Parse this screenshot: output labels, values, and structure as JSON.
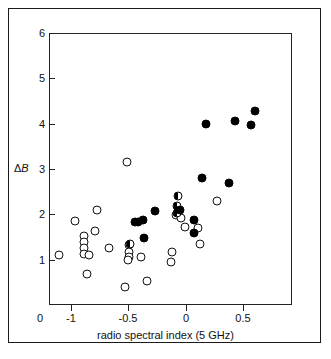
{
  "figure": {
    "background_color": "#ffffff",
    "frame_color": "#1a1a1a",
    "marker_color": "#000000"
  },
  "axes": {
    "y_title_delta": "Δ",
    "y_title_symbol": "B",
    "x_title": "radio spectral index (5 GHz)",
    "origin_label": "0",
    "y_ticks": [
      "0",
      "1",
      "2",
      "3",
      "4",
      "5",
      "6"
    ],
    "x_ticks": [
      "-1",
      "-0.5",
      "0",
      "0.5"
    ]
  },
  "chart_data": {
    "type": "scatter",
    "title": "",
    "xlabel": "radio spectral index (5 GHz)",
    "ylabel": "ΔB",
    "xlim": [
      -1.13,
      1.0
    ],
    "ylim": [
      0,
      6
    ],
    "xticks": [
      -1,
      -0.5,
      0,
      0.5
    ],
    "yticks": [
      0,
      1,
      2,
      3,
      4,
      5,
      6
    ],
    "grid": false,
    "legend": "none",
    "series": [
      {
        "name": "open-circle",
        "marker": "open",
        "points": [
          [
            -1.04,
            1.1
          ],
          [
            -0.9,
            1.85
          ],
          [
            -0.82,
            1.52
          ],
          [
            -0.82,
            1.38
          ],
          [
            -0.82,
            1.25
          ],
          [
            -0.82,
            1.13
          ],
          [
            -0.78,
            1.1
          ],
          [
            -0.8,
            0.68
          ],
          [
            -0.71,
            2.09
          ],
          [
            -0.73,
            1.64
          ],
          [
            -0.6,
            1.26
          ],
          [
            -0.45,
            3.15
          ],
          [
            -0.43,
            1.32
          ],
          [
            -0.43,
            1.17
          ],
          [
            -0.43,
            1.05
          ],
          [
            -0.44,
            1.0
          ],
          [
            -0.46,
            0.39
          ],
          [
            -0.32,
            1.06
          ],
          [
            -0.27,
            0.54
          ],
          [
            -0.02,
            1.99
          ],
          [
            0.03,
            1.93
          ],
          [
            -0.05,
            1.18
          ],
          [
            -0.06,
            0.95
          ],
          [
            0.06,
            1.72
          ],
          [
            0.18,
            1.7
          ],
          [
            0.19,
            1.35
          ],
          [
            0.34,
            2.3
          ]
        ]
      },
      {
        "name": "half-filled-circle",
        "marker": "half",
        "points": [
          [
            0.0,
            2.4
          ],
          [
            -0.01,
            2.18
          ],
          [
            -0.01,
            2.02
          ],
          [
            -0.42,
            1.34
          ]
        ]
      },
      {
        "name": "filled-circle",
        "marker": "filled",
        "points": [
          [
            -0.38,
            1.83
          ],
          [
            -0.35,
            1.84
          ],
          [
            -0.31,
            1.87
          ],
          [
            -0.3,
            1.48
          ],
          [
            -0.2,
            2.08
          ],
          [
            0.02,
            2.1
          ],
          [
            0.14,
            1.87
          ],
          [
            0.14,
            1.58
          ],
          [
            0.21,
            2.8
          ],
          [
            0.25,
            4.0
          ],
          [
            0.45,
            2.69
          ],
          [
            0.5,
            4.05
          ],
          [
            0.64,
            3.98
          ],
          [
            0.68,
            4.28
          ]
        ]
      }
    ]
  }
}
